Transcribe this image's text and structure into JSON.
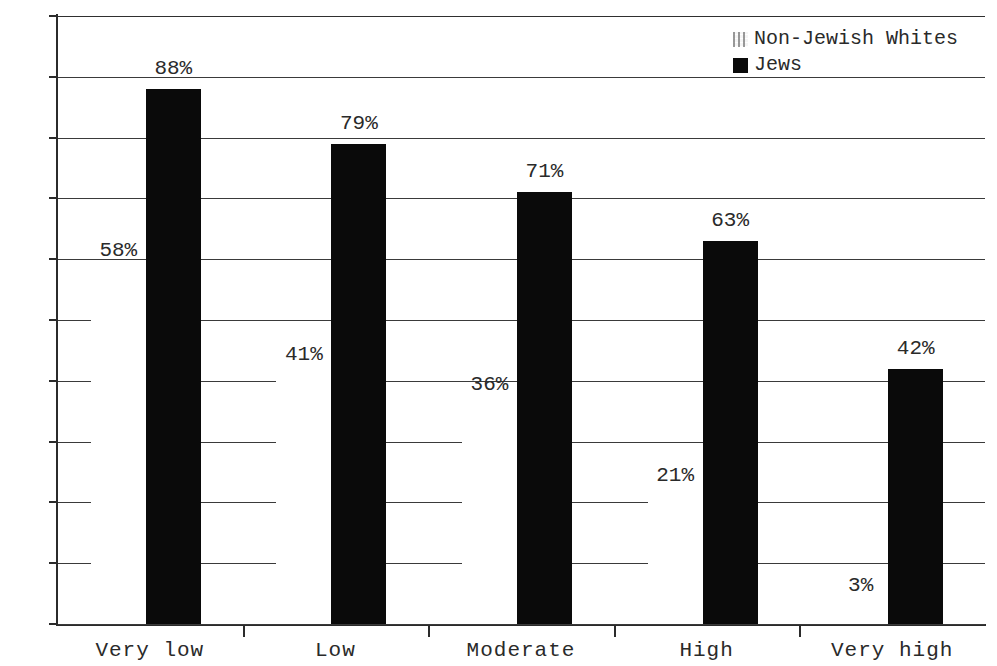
{
  "chart_data": {
    "type": "bar",
    "title": "",
    "subtitle": "",
    "xlabel": "",
    "ylabel": "",
    "categories": [
      "Very low",
      "Low",
      "Moderate",
      "High",
      "Very high"
    ],
    "series": [
      {
        "name": "Non-Jewish Whites",
        "values": [
          58,
          41,
          36,
          21,
          3
        ],
        "labels": [
          "58%",
          "41%",
          "36%",
          "21%",
          "3%"
        ],
        "color": "#e8e8e8",
        "fill": "light-pattern"
      },
      {
        "name": "Jews",
        "values": [
          88,
          79,
          71,
          63,
          42
        ],
        "labels": [
          "88%",
          "79%",
          "71%",
          "63%",
          "42%"
        ],
        "color": "#0a0a0a",
        "fill": "solid-black"
      }
    ],
    "ylim": [
      0,
      100
    ],
    "ytick_step": 10,
    "ytick_labels": [
      "0",
      "10",
      "20",
      "30",
      "40",
      "50",
      "60",
      "70",
      "80",
      "90",
      "100"
    ],
    "grid": true,
    "grid_orientation": "horizontal",
    "legend_position": "top-right",
    "value_labels_shown": true
  },
  "legend": {
    "entries": [
      {
        "label": "Non-Jewish Whites",
        "swatch": "light-pattern-swatch"
      },
      {
        "label": "Jews",
        "swatch": "solid-black-swatch"
      }
    ]
  }
}
